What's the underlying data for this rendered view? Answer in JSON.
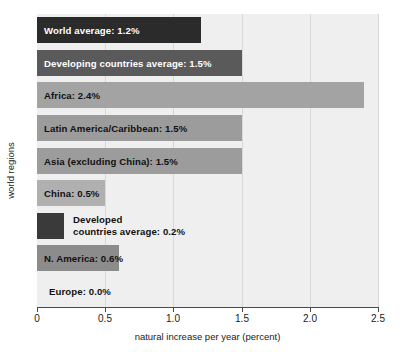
{
  "chart_data": {
    "type": "bar",
    "orientation": "horizontal",
    "title": "",
    "xlabel": "natural increase per year (percent)",
    "ylabel": "world regions",
    "xlim": [
      0,
      2.5
    ],
    "xticks": [
      "0",
      "0.5",
      "1.0",
      "1.5",
      "2.0",
      "2.5"
    ],
    "xtick_values": [
      0,
      0.5,
      1.0,
      1.5,
      2.0,
      2.5
    ],
    "grid": true,
    "legend": "none",
    "categories": [
      "World average",
      "Developing countries average",
      "Africa",
      "Latin America/Caribbean",
      "Asia (excluding China)",
      "China",
      "Developed countries average",
      "N. America",
      "Europe"
    ],
    "values": [
      1.2,
      1.5,
      2.4,
      1.5,
      1.5,
      0.5,
      0.2,
      0.6,
      0.0
    ],
    "bars": [
      {
        "label": "World average: 1.2%",
        "label_line1": "World average: 1.2%",
        "label_line2": "",
        "value": 1.2,
        "color": "#2b2b2b",
        "text_color": "#ffffff",
        "label_position": "inside"
      },
      {
        "label": "Developing countries average: 1.5%",
        "label_line1": "Developing countries average: 1.5%",
        "label_line2": "",
        "value": 1.5,
        "color": "#5a5a5a",
        "text_color": "#ffffff",
        "label_position": "inside"
      },
      {
        "label": "Africa: 2.4%",
        "label_line1": "Africa: 2.4%",
        "label_line2": "",
        "value": 2.4,
        "color": "#a3a3a3",
        "text_color": "#111111",
        "label_position": "inside"
      },
      {
        "label": "Latin America/Caribbean: 1.5%",
        "label_line1": "Latin America/Caribbean: 1.5%",
        "label_line2": "",
        "value": 1.5,
        "color": "#9c9c9c",
        "text_color": "#111111",
        "label_position": "inside"
      },
      {
        "label": "Asia (excluding China): 1.5%",
        "label_line1": "Asia (excluding China): 1.5%",
        "label_line2": "",
        "value": 1.5,
        "color": "#9c9c9c",
        "text_color": "#111111",
        "label_position": "inside"
      },
      {
        "label": "China: 0.5%",
        "label_line1": "China: 0.5%",
        "label_line2": "",
        "value": 0.5,
        "color": "#b0b0b0",
        "text_color": "#111111",
        "label_position": "inside"
      },
      {
        "label": "Developed countries average: 0.2%",
        "label_line1": "Developed",
        "label_line2": "countries average: 0.2%",
        "value": 0.2,
        "color": "#3a3a3a",
        "text_color": "#111111",
        "label_position": "outside"
      },
      {
        "label": "N. America: 0.6%",
        "label_line1": "N. America: 0.6%",
        "label_line2": "",
        "value": 0.6,
        "color": "#8c8c8c",
        "text_color": "#111111",
        "label_position": "inside"
      },
      {
        "label": "Europe: 0.0%",
        "label_line1": "Europe: 0.0%",
        "label_line2": "",
        "value": 0.0,
        "color": "#efefef",
        "text_color": "#111111",
        "label_position": "outside-zero"
      }
    ]
  },
  "colors": {
    "plot_background": "#efefef",
    "gridline": "#d8d8d8",
    "axis": "#4a4a4a",
    "page_background": "#ffffff"
  }
}
